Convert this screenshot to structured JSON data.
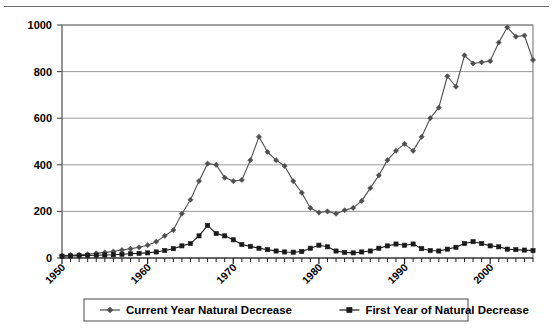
{
  "figure": {
    "background_color": "#ffffff",
    "frame_color": "#7d7d7d",
    "gridline_color": "#9a9a9a",
    "scan_rule_color": "#6f6f6f"
  },
  "chart_data": {
    "type": "line",
    "title": "",
    "subtitle": "",
    "xlabel": "",
    "ylabel": "",
    "xlim": [
      1950,
      2005
    ],
    "ylim": [
      0,
      1000
    ],
    "yticks": [
      0,
      200,
      400,
      600,
      800,
      1000
    ],
    "ytick_labels": [
      "0",
      "200",
      "400",
      "600",
      "800",
      "1000"
    ],
    "xticks": [
      1950,
      1960,
      1970,
      1980,
      1990,
      2000
    ],
    "xtick_labels": [
      "1950",
      "1960",
      "1970",
      "1980",
      "1990",
      "2000"
    ],
    "xtick_rotation_deg": 45,
    "minor_xticks_every": 1,
    "grid": "horizontal",
    "legend_position": "bottom-center",
    "x": [
      1950,
      1951,
      1952,
      1953,
      1954,
      1955,
      1956,
      1957,
      1958,
      1959,
      1960,
      1961,
      1962,
      1963,
      1964,
      1965,
      1966,
      1967,
      1968,
      1969,
      1970,
      1971,
      1972,
      1973,
      1974,
      1975,
      1976,
      1977,
      1978,
      1979,
      1980,
      1981,
      1982,
      1983,
      1984,
      1985,
      1986,
      1987,
      1988,
      1989,
      1990,
      1991,
      1992,
      1993,
      1994,
      1995,
      1996,
      1997,
      1998,
      1999,
      2000,
      2001,
      2002,
      2003,
      2004,
      2005
    ],
    "series": [
      {
        "name": "Current Year Natural Decrease",
        "marker": "diamond",
        "color": "#4f4f4f",
        "values": [
          10,
          12,
          14,
          16,
          20,
          24,
          28,
          34,
          40,
          46,
          55,
          70,
          95,
          120,
          190,
          250,
          330,
          405,
          400,
          345,
          330,
          335,
          420,
          520,
          455,
          420,
          395,
          330,
          280,
          215,
          195,
          200,
          190,
          205,
          215,
          245,
          300,
          355,
          420,
          460,
          490,
          460,
          520,
          600,
          645,
          780,
          735,
          870,
          835,
          840,
          845,
          925,
          990,
          950,
          955,
          850
        ]
      },
      {
        "name": "First Year of Natural Decrease",
        "marker": "square",
        "color": "#1a1a1a",
        "values": [
          8,
          9,
          10,
          11,
          12,
          13,
          14,
          16,
          18,
          20,
          22,
          26,
          32,
          40,
          52,
          62,
          95,
          140,
          105,
          95,
          78,
          58,
          50,
          42,
          36,
          30,
          26,
          25,
          28,
          42,
          55,
          48,
          30,
          24,
          22,
          26,
          30,
          42,
          52,
          60,
          55,
          60,
          40,
          32,
          30,
          38,
          46,
          62,
          70,
          62,
          52,
          48,
          38,
          36,
          34,
          32
        ]
      }
    ],
    "legend": [
      {
        "label": "Current Year Natural Decrease",
        "marker": "diamond",
        "color": "#4f4f4f"
      },
      {
        "label": "First Year of Natural Decrease",
        "marker": "square",
        "color": "#1a1a1a"
      }
    ]
  }
}
